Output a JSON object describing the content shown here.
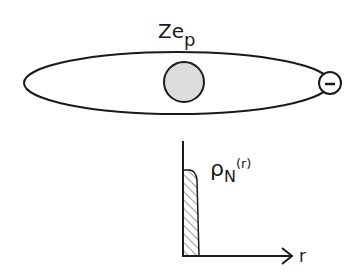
{
  "atom": {
    "charge_label": "Ze",
    "charge_subscript": "p",
    "electron_symbol": "-",
    "nucleus_fill": "#dcdcdc",
    "stroke_color": "#1a1a1a"
  },
  "density_plot": {
    "function_symbol": "ρ",
    "function_subscript": "N",
    "function_argument": "(r)",
    "x_axis_label": "r"
  }
}
